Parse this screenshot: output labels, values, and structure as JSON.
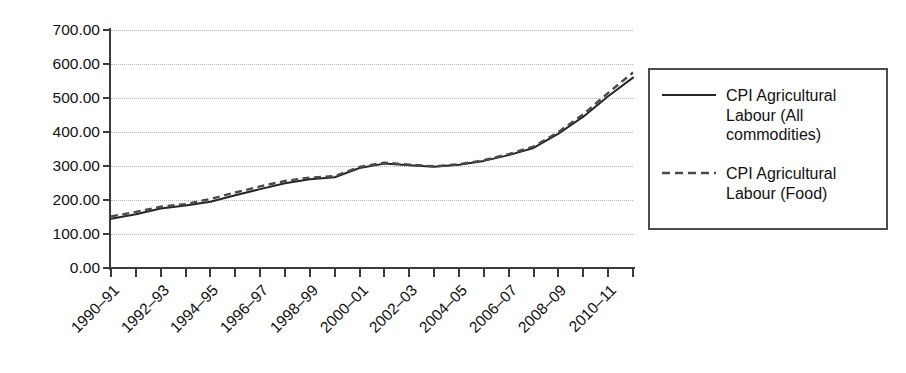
{
  "chart_data": {
    "type": "line",
    "title": "",
    "xlabel": "",
    "ylabel": "",
    "ylim": [
      0,
      700
    ],
    "ytick_values": [
      0,
      100,
      200,
      300,
      400,
      500,
      600,
      700
    ],
    "ytick_labels": [
      "0.00",
      "100.00",
      "200.00",
      "300.00",
      "400.00",
      "500.00",
      "600.00",
      "700.00"
    ],
    "grid": true,
    "grid_style": "dotted-horizontal",
    "legend_position": "right-outside",
    "x": [
      "1990–91",
      "1991–92",
      "1992–93",
      "1993–94",
      "1994–95",
      "1995–96",
      "1996–97",
      "1997–98",
      "1998–99",
      "1999–2000",
      "2000–01",
      "2001–02",
      "2002–03",
      "2003–04",
      "2004–05",
      "2005–06",
      "2006–07",
      "2007–08",
      "2008–09",
      "2009–10",
      "2010–11",
      "2011–12"
    ],
    "xtick_labels_shown": [
      "1990–91",
      "1992–93",
      "1994–95",
      "1996–97",
      "1998–99",
      "2000–01",
      "2002–03",
      "2004–05",
      "2006–07",
      "2008–09",
      "2010–11"
    ],
    "series": [
      {
        "name": "CPI Agricultural Labour (All commodities)",
        "style": "solid",
        "color": "#262626",
        "values": [
          145,
          158,
          175,
          184,
          195,
          214,
          232,
          249,
          261,
          267,
          294,
          307,
          302,
          298,
          304,
          315,
          332,
          353,
          395,
          445,
          505,
          560
        ]
      },
      {
        "name": "CPI Agricultural Labour (Food)",
        "style": "dashed",
        "color": "#4a4a4a",
        "values": [
          152,
          165,
          180,
          188,
          203,
          222,
          240,
          256,
          266,
          270,
          297,
          310,
          304,
          299,
          305,
          317,
          335,
          357,
          400,
          452,
          515,
          575
        ]
      }
    ]
  },
  "legend": {
    "entries": [
      {
        "label": "CPI Agricultural Labour (All commodities)",
        "style": "solid"
      },
      {
        "label": "CPI Agricultural Labour (Food)",
        "style": "dashed"
      }
    ]
  }
}
